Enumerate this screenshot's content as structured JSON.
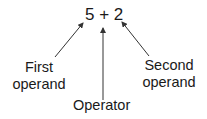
{
  "diagram": {
    "expression": "5 + 2",
    "labels": {
      "first_line1": "First",
      "first_line2": "operand",
      "operator": "Operator",
      "second_line1": "Second",
      "second_line2": "operand"
    },
    "arrows": [
      {
        "from": "First operand",
        "to": "5"
      },
      {
        "from": "Operator",
        "to": "+"
      },
      {
        "from": "Second operand",
        "to": "2"
      }
    ],
    "colors": {
      "text": "#1a1a1a",
      "arrow": "#333333",
      "background": "#ffffff"
    }
  }
}
